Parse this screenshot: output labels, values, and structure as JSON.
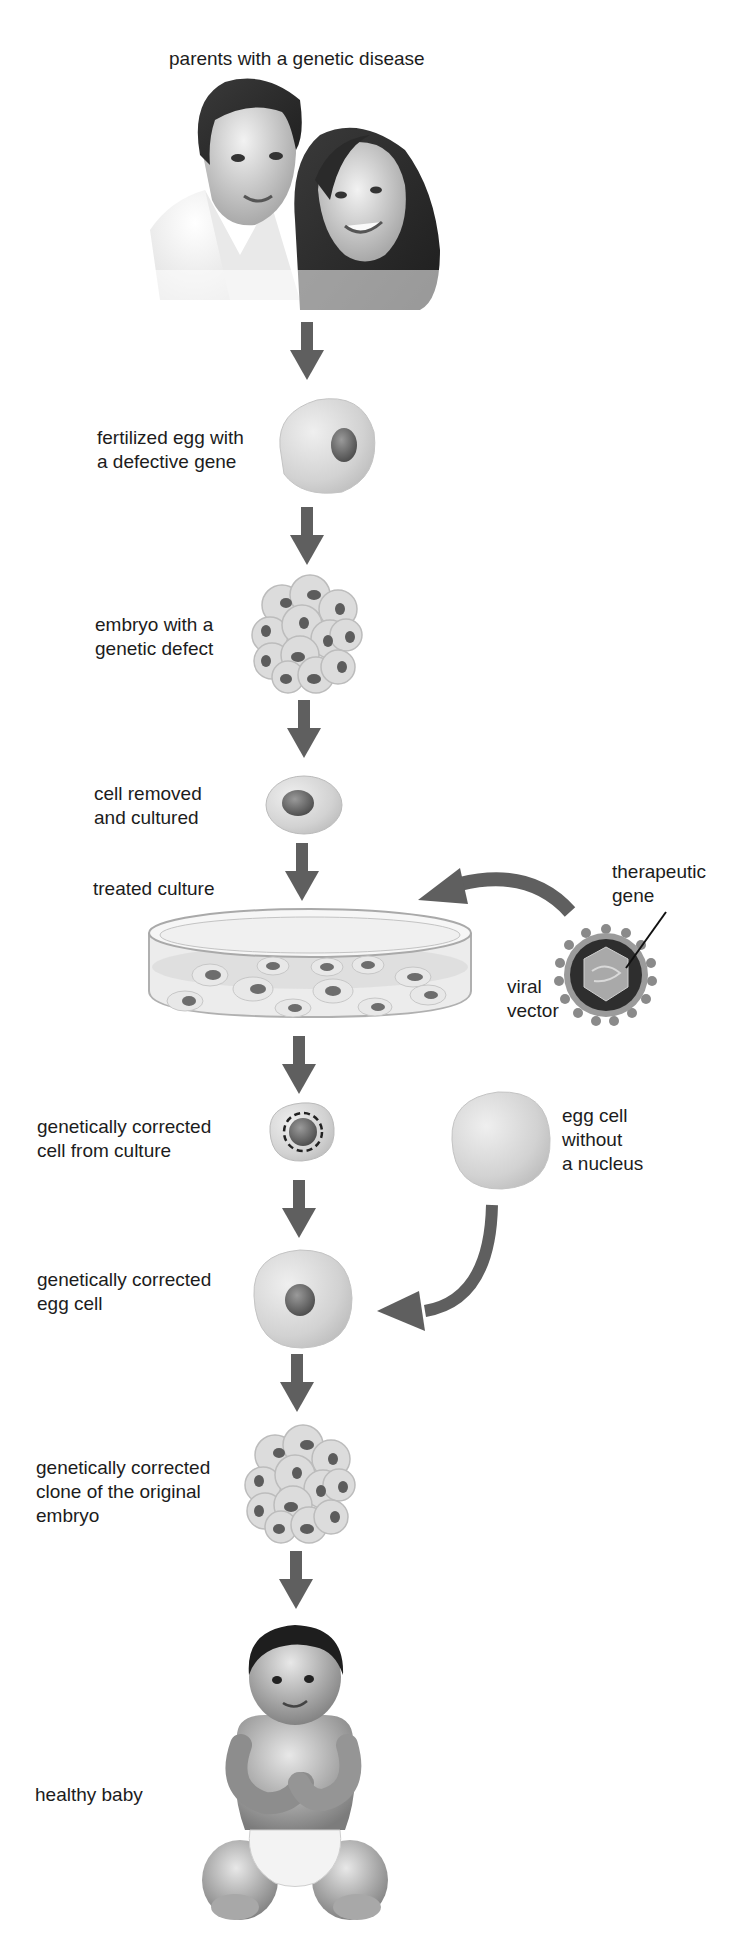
{
  "colors": {
    "arrow": "#5f5f5f",
    "cell_fill": "#d6d6d6",
    "cell_edge": "#b5b5b5",
    "nucleus": "#6f6f6f",
    "text": "#1c1c1c"
  },
  "steps": [
    {
      "id": "parents",
      "label": "parents with a genetic disease",
      "icon": "parents-portrait"
    },
    {
      "id": "fertilized-egg",
      "label": "fertilized egg with\na defective gene",
      "icon": "egg-cell-with-nucleus"
    },
    {
      "id": "embryo-defect",
      "label": "embryo with a\ngenetic defect",
      "icon": "embryo-cluster"
    },
    {
      "id": "cell-removed",
      "label": "cell removed\nand cultured",
      "icon": "single-cell"
    },
    {
      "id": "treated-culture",
      "label": "treated culture",
      "icon": "petri-dish"
    },
    {
      "id": "corrected-cell",
      "label": "genetically corrected\ncell from culture",
      "icon": "cell-with-dashed-nucleus"
    },
    {
      "id": "corrected-egg",
      "label": "genetically corrected\negg cell",
      "icon": "egg-cell-with-nucleus"
    },
    {
      "id": "corrected-clone",
      "label": "genetically corrected\nclone of the original\nembryo",
      "icon": "embryo-cluster"
    },
    {
      "id": "healthy-baby",
      "label": "healthy baby",
      "icon": "baby-portrait"
    }
  ],
  "side_items": {
    "therapeutic_gene": "therapeutic\ngene",
    "viral_vector": "viral\nvector",
    "enucleated_egg": "egg cell\nwithout\na nucleus"
  }
}
